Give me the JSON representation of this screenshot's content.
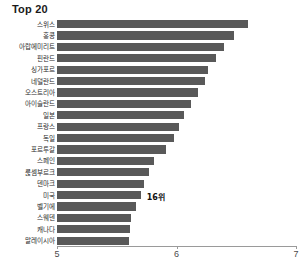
{
  "chart_data": {
    "type": "bar",
    "orientation": "horizontal",
    "title": "Top 20",
    "xlabel": "",
    "ylabel": "",
    "xlim": [
      5,
      7
    ],
    "xticks": [
      5,
      6,
      7
    ],
    "xtick_labels": [
      "5",
      "6",
      "7"
    ],
    "grid": false,
    "legend": null,
    "bar_color": "#595959",
    "categories": [
      "스위스",
      "홍콩",
      "아랍에미리트",
      "핀란드",
      "싱가포르",
      "네덜란드",
      "오스트리아",
      "아이슬란드",
      "일본",
      "프랑스",
      "독일",
      "포르투갈",
      "스페인",
      "룭셈부르크",
      "덴마크",
      "미국",
      "벨기에",
      "스웨덴",
      "캐나다",
      "말레이시아"
    ],
    "values": [
      6.6,
      6.48,
      6.4,
      6.33,
      6.26,
      6.24,
      6.18,
      6.12,
      6.06,
      6.02,
      5.98,
      5.91,
      5.81,
      5.77,
      5.73,
      5.7,
      5.66,
      5.62,
      5.61,
      5.6
    ],
    "annotations": [
      {
        "category_index": 15,
        "text": "16위"
      }
    ]
  }
}
